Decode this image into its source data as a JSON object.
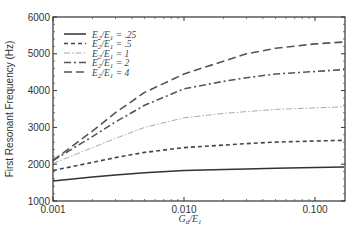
{
  "chart_data": {
    "type": "line",
    "title": "",
    "xlabel": "G_d/E_1",
    "ylabel": "First Resonant Frequency (Hz)",
    "xscale": "log",
    "xlim": [
      0.001,
      0.2
    ],
    "ylim": [
      1000,
      6000
    ],
    "xticks": [
      0.001,
      0.01,
      0.1
    ],
    "xtick_labels": [
      "0.001",
      "0.010",
      "0.100"
    ],
    "yticks": [
      1000,
      2000,
      3000,
      4000,
      5000,
      6000
    ],
    "ytick_labels": [
      "1000",
      "2000",
      "3000",
      "4000",
      "5000",
      "6000"
    ],
    "grid": false,
    "legend_position": "upper left",
    "x": [
      0.001,
      0.002,
      0.003,
      0.005,
      0.01,
      0.02,
      0.03,
      0.05,
      0.1,
      0.2
    ],
    "series": [
      {
        "name": "E2/E1 = .25",
        "label_main": "E",
        "ratio": ".25",
        "style": "solid",
        "color": "#333333",
        "values": [
          1540,
          1650,
          1710,
          1770,
          1830,
          1860,
          1870,
          1890,
          1910,
          1920
        ]
      },
      {
        "name": "E2/E1 = .5",
        "label_main": "E",
        "ratio": ".5",
        "style": "short-dash",
        "color": "#444444",
        "values": [
          1830,
          2050,
          2180,
          2320,
          2450,
          2520,
          2560,
          2600,
          2630,
          2650
        ]
      },
      {
        "name": "E2/E1 = 1",
        "label_main": "E",
        "ratio": "1",
        "style": "dash-dot-light",
        "color": "#aaaaaa",
        "values": [
          2020,
          2450,
          2700,
          3000,
          3260,
          3380,
          3430,
          3490,
          3530,
          3560
        ]
      },
      {
        "name": "E2/E1 = 2",
        "label_main": "E",
        "ratio": "2",
        "style": "dash-dot",
        "color": "#555555",
        "values": [
          2100,
          2750,
          3150,
          3600,
          4050,
          4250,
          4350,
          4450,
          4520,
          4570
        ]
      },
      {
        "name": "E2/E1 = 4",
        "label_main": "E",
        "ratio": "4",
        "style": "long-dash",
        "color": "#555555",
        "values": [
          2100,
          2900,
          3400,
          3950,
          4450,
          4800,
          5000,
          5150,
          5270,
          5320
        ]
      }
    ]
  },
  "legend": {
    "entries": [
      {
        "text": "E2/E1 = .25"
      },
      {
        "text": "E2/E1 = .5"
      },
      {
        "text": "E2/E1 = 1"
      },
      {
        "text": "E2/E1 = 2"
      },
      {
        "text": "E2/E1 = 4"
      }
    ]
  }
}
